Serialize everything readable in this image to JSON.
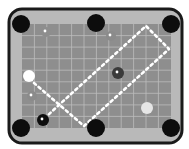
{
  "game": {
    "type": "billiards-table",
    "colors": {
      "frame": "#1a1a1a",
      "rail": "#b9b9b9",
      "felt": "#8e8e8e",
      "grid": "#c8c8c8",
      "pocket": "#0d0d0d",
      "path": "#ffffff"
    },
    "table": {
      "x": 9,
      "y": 9,
      "w": 173,
      "h": 134,
      "r": 13
    },
    "felt": {
      "x": 22,
      "y": 24,
      "w": 149,
      "h": 104
    },
    "grid": {
      "spacing": 12.4,
      "cols": 12,
      "rows": 9
    },
    "pockets": [
      {
        "id": "top-left",
        "x": 21,
        "y": 24
      },
      {
        "id": "top-middle",
        "x": 96,
        "y": 23
      },
      {
        "id": "top-right",
        "x": 171,
        "y": 24
      },
      {
        "id": "bottom-left",
        "x": 21,
        "y": 128
      },
      {
        "id": "bottom-middle",
        "x": 96,
        "y": 128
      },
      {
        "id": "bottom-right",
        "x": 171,
        "y": 128
      }
    ],
    "balls": [
      {
        "id": "cue-ball",
        "x": 29,
        "y": 76,
        "r": 6,
        "fill": "#ffffff",
        "dot": false
      },
      {
        "id": "dark-ball",
        "x": 118,
        "y": 73,
        "r": 6,
        "fill": "#3a3a3a",
        "dot": true
      },
      {
        "id": "black-ball",
        "x": 43,
        "y": 120,
        "r": 6,
        "fill": "#0d0d0d",
        "dot": true
      },
      {
        "id": "light-ball",
        "x": 147,
        "y": 108,
        "r": 6,
        "fill": "#e6e6e6",
        "dot": false
      },
      {
        "id": "faint-ball-1",
        "x": 46,
        "y": 32,
        "r": 5,
        "fill": "#8e8e8e",
        "dot": true
      },
      {
        "id": "faint-ball-2",
        "x": 111,
        "y": 36,
        "r": 5,
        "fill": "#8b8b8b",
        "dot": true
      },
      {
        "id": "faint-ball-3",
        "x": 32,
        "y": 96,
        "r": 5,
        "fill": "#8b8b8b",
        "dot": true
      }
    ],
    "shot_path": [
      [
        34,
        83
      ],
      [
        84,
        126
      ],
      [
        169,
        49
      ],
      [
        146,
        26
      ],
      [
        60,
        104
      ],
      [
        47,
        116
      ]
    ]
  }
}
